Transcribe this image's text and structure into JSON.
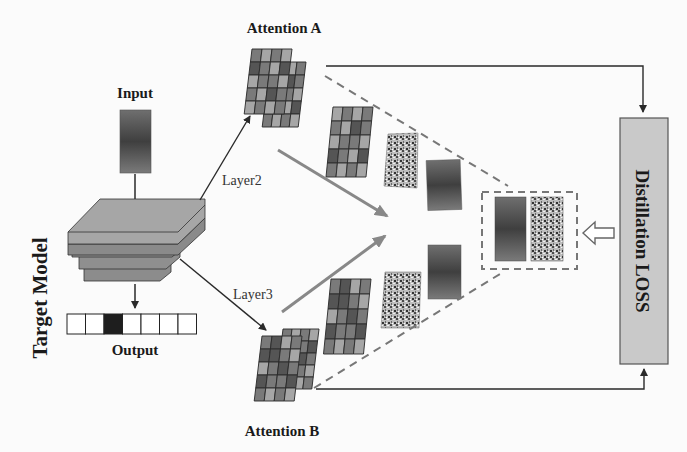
{
  "labels": {
    "input": "Input",
    "output": "Output",
    "target_model": "Target Model",
    "attention_a": "Attention A",
    "attention_b": "Attention B",
    "layer2": "Layer2",
    "layer3": "Layer3",
    "distillation_loss": "Distillation LOSS"
  },
  "output_vector": {
    "cells": 7,
    "active_index": 2
  },
  "colors": {
    "model_layer": "#8f8f8f",
    "model_top": "#a8a8a8",
    "loss_box": "#c8c8c8",
    "arrow_gray": "#8a8a8a",
    "line": "#2a2a2a",
    "cell_dark": "#555555",
    "cell_mid": "#7a7a7a",
    "cell_light": "#a6a6a6"
  },
  "attention_grid_a": [
    [
      2,
      1,
      2,
      1
    ],
    [
      1,
      2,
      0,
      1
    ],
    [
      2,
      1,
      1,
      2
    ],
    [
      0,
      1,
      2,
      0
    ],
    [
      1,
      2,
      1,
      2
    ]
  ],
  "attention_grid_b": [
    [
      1,
      0,
      2,
      1
    ],
    [
      0,
      0,
      1,
      2
    ],
    [
      2,
      1,
      0,
      1
    ],
    [
      0,
      1,
      1,
      0
    ],
    [
      1,
      2,
      1,
      2
    ]
  ]
}
